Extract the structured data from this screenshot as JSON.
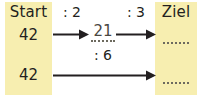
{
  "worksheet": {
    "type": "division-chain-exercise",
    "columns": {
      "start": {
        "header": "Start",
        "values": [
          "42",
          "42"
        ]
      },
      "ziel": {
        "header": "Ziel",
        "values": [
          "",
          ""
        ],
        "blank_placeholder": "......"
      }
    },
    "rows": [
      {
        "start": "42",
        "steps": [
          {
            "operation": ": 2",
            "result": "21",
            "filled": true
          },
          {
            "operation": ": 3",
            "result": "",
            "filled": false
          }
        ]
      },
      {
        "start": "42",
        "steps": [
          {
            "operation": ": 6",
            "result": "",
            "filled": false
          }
        ]
      }
    ],
    "arrows": [
      {
        "name": "arrow-row1-step1",
        "direction": "right"
      },
      {
        "name": "arrow-row1-step2",
        "direction": "right"
      },
      {
        "name": "arrow-row2-step1",
        "direction": "right"
      }
    ],
    "colors": {
      "column_background": "#f7eeb0",
      "text": "#231f20",
      "answer_text": "#4a4741",
      "rule": "#6d6a5e",
      "page_background": "#ffffff"
    }
  }
}
